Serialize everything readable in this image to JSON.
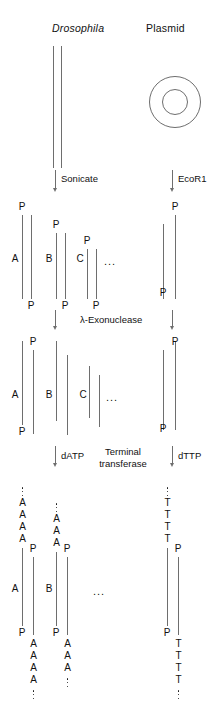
{
  "figure": {
    "title_left": "Drosophila",
    "title_right": "Plasmid",
    "steps": {
      "sonicate": "Sonicate",
      "ecor1": "EcoR1",
      "exonuclease": "λ-Exonuclease",
      "datp": "dATP",
      "dttp": "dTTP",
      "terminal_line1": "Terminal",
      "terminal_line2": "transferase"
    },
    "glyphs": {
      "phosphate": "P",
      "adenine": "A",
      "thymine": "T",
      "ellipsis": "..."
    },
    "fragment_labels": {
      "a": "A",
      "b": "B",
      "c": "C"
    },
    "colors": {
      "strand": "#6e6e6e",
      "text": "#111111",
      "background": "#ffffff"
    }
  }
}
